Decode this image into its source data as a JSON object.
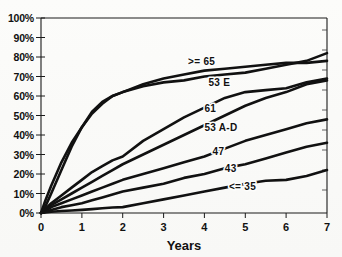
{
  "chart_data": {
    "type": "line",
    "title": "",
    "subtitle": "",
    "xlabel": "Years",
    "ylabel": "",
    "xlim": [
      0,
      7
    ],
    "ylim": [
      0,
      100
    ],
    "grid": false,
    "legend_position": "inline-labels",
    "x_ticks": [
      "0",
      "1",
      "2",
      "3",
      "4",
      "5",
      "6",
      "7"
    ],
    "x_tick_values": [
      0,
      1,
      2,
      3,
      4,
      5,
      6,
      7
    ],
    "y_ticks": [
      "0%",
      "10%",
      "20%",
      "30%",
      "40%",
      "50%",
      "60%",
      "70%",
      "80%",
      "90%",
      "100%"
    ],
    "y_tick_values": [
      0,
      10,
      20,
      30,
      40,
      50,
      60,
      70,
      80,
      90,
      100
    ],
    "x": [
      0,
      0.1,
      0.25,
      0.5,
      0.75,
      1,
      1.25,
      1.5,
      1.75,
      2,
      2.5,
      3,
      3.5,
      4,
      4.5,
      5,
      5.5,
      6,
      6.5,
      7
    ],
    "series": [
      {
        "name": ">= 65",
        "label": ">= 65",
        "label_x": 3.6,
        "label_y": 76,
        "color": "#111111",
        "values": [
          0,
          6,
          14,
          26,
          36,
          44,
          51,
          56,
          60,
          62,
          66,
          69,
          71,
          73,
          74,
          75,
          76,
          77,
          77,
          78
        ]
      },
      {
        "name": "53 E",
        "label": "53 E",
        "label_x": 4.1,
        "label_y": 65,
        "color": "#111111",
        "values": [
          0,
          3,
          10,
          22,
          34,
          44,
          52,
          57,
          60,
          62,
          65,
          67,
          68,
          70,
          71,
          72,
          74,
          76,
          78,
          82
        ]
      },
      {
        "name": "61",
        "label": "61",
        "label_x": 4.0,
        "label_y": 52,
        "color": "#111111",
        "values": [
          0,
          2,
          5,
          9,
          13,
          17,
          21,
          24,
          27,
          29,
          37,
          43,
          49,
          54,
          59,
          62,
          63,
          64,
          67,
          69
        ]
      },
      {
        "name": "53 A-D",
        "label": "53 A-D",
        "label_x": 4.0,
        "label_y": 42,
        "color": "#111111",
        "values": [
          0,
          1,
          4,
          7,
          10,
          13,
          16,
          19,
          22,
          25,
          30,
          35,
          40,
          45,
          50,
          55,
          59,
          62,
          66,
          68
        ]
      },
      {
        "name": "47",
        "label": "47",
        "label_x": 4.2,
        "label_y": 30,
        "color": "#111111",
        "values": [
          0,
          1,
          3,
          5,
          7,
          9,
          11,
          13,
          15,
          17,
          20,
          23,
          26,
          29,
          33,
          37,
          40,
          43,
          46,
          48
        ]
      },
      {
        "name": "43",
        "label": "43",
        "label_x": 4.5,
        "label_y": 21,
        "color": "#111111",
        "values": [
          0,
          0.5,
          1.5,
          3,
          4,
          5,
          6.5,
          8,
          9.5,
          11,
          13,
          15,
          18,
          20,
          23,
          25,
          28,
          31,
          34,
          36
        ]
      },
      {
        "name": "<= 35",
        "label": "<= 35",
        "label_x": 4.6,
        "label_y": 12,
        "color": "#111111",
        "values": [
          0,
          0.3,
          0.6,
          1,
          1.3,
          1.6,
          2,
          2.4,
          2.8,
          3,
          5,
          7,
          9,
          11,
          13,
          15,
          16.5,
          17,
          19,
          22
        ]
      }
    ]
  },
  "figure": {
    "background_color": "#fdfdfc",
    "axis_color": "#1a1a1a",
    "line_color": "#111111"
  }
}
